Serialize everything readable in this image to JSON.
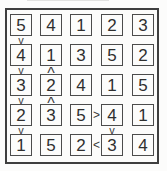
{
  "puzzle": {
    "type": "futoshiki",
    "size": 5,
    "grid": [
      [
        "5",
        "4",
        "1",
        "2",
        "3"
      ],
      [
        "4",
        "1",
        "3",
        "5",
        "2"
      ],
      [
        "3",
        "2",
        "4",
        "1",
        "5"
      ],
      [
        "2",
        "3",
        "5",
        "4",
        "1"
      ],
      [
        "1",
        "5",
        "2",
        "3",
        "4"
      ]
    ],
    "constraints": [
      {
        "between": "r1c1-r2c1",
        "orientation": "vertical",
        "symbol": "v"
      },
      {
        "between": "r2c1-r3c1",
        "orientation": "vertical",
        "symbol": "v"
      },
      {
        "between": "r2c2-r3c2",
        "orientation": "vertical",
        "symbol": "^"
      },
      {
        "between": "r3c1-r4c1",
        "orientation": "vertical",
        "symbol": "v"
      },
      {
        "between": "r3c2-r4c2",
        "orientation": "vertical",
        "symbol": "^"
      },
      {
        "between": "r4c1-r5c1",
        "orientation": "vertical",
        "symbol": "v"
      },
      {
        "between": "r4c3-r4c4",
        "orientation": "horizontal",
        "symbol": ">"
      },
      {
        "between": "r4c4-r5c4",
        "orientation": "vertical",
        "symbol": "v"
      },
      {
        "between": "r5c3-r5c4",
        "orientation": "horizontal",
        "symbol": "<"
      }
    ],
    "colors": {
      "outer_border": "#3f3f3f",
      "cell_border": "#4c4c4c",
      "digit": "#2f2f2f",
      "background": "#fcfcfb"
    }
  }
}
